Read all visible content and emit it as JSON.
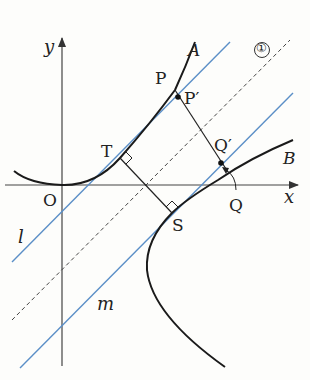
{
  "diagram": {
    "type": "coordinate-geometry",
    "axes": {
      "x_label": "x",
      "y_label": "y",
      "origin_label": "O"
    },
    "curves": [
      {
        "id": "A",
        "label": "A",
        "kind": "parabola-like curve"
      },
      {
        "id": "B",
        "label": "B",
        "kind": "hyperbola-like branch"
      }
    ],
    "lines": [
      {
        "id": "l",
        "label": "l",
        "color": "#5b8fc7",
        "style": "solid",
        "role": "tangent to A at T"
      },
      {
        "id": "m",
        "label": "m",
        "color": "#5b8fc7",
        "style": "solid",
        "role": "tangent to B at S"
      },
      {
        "id": "mid",
        "label": "①",
        "color": "#333333",
        "style": "dashed",
        "role": "midline between l and m"
      }
    ],
    "points": [
      {
        "label": "O"
      },
      {
        "label": "T"
      },
      {
        "label": "S"
      },
      {
        "label": "P"
      },
      {
        "label": "P′"
      },
      {
        "label": "Q′"
      },
      {
        "label": "Q"
      }
    ],
    "annotations": {
      "right_angle_marks": [
        "T",
        "S"
      ],
      "circled_number": "①"
    }
  },
  "labels": {
    "y": "y",
    "x": "x",
    "O": "O",
    "A": "A",
    "B": "B",
    "l": "l",
    "m": "m",
    "one": "①",
    "T": "T",
    "S": "S",
    "P": "P",
    "Pp": "P′",
    "Qp": "Q′",
    "Q": "Q"
  },
  "colors": {
    "curve": "#1a1a1a",
    "axis": "#444444",
    "tangent": "#5b8fc7",
    "dashed": "#444444"
  }
}
